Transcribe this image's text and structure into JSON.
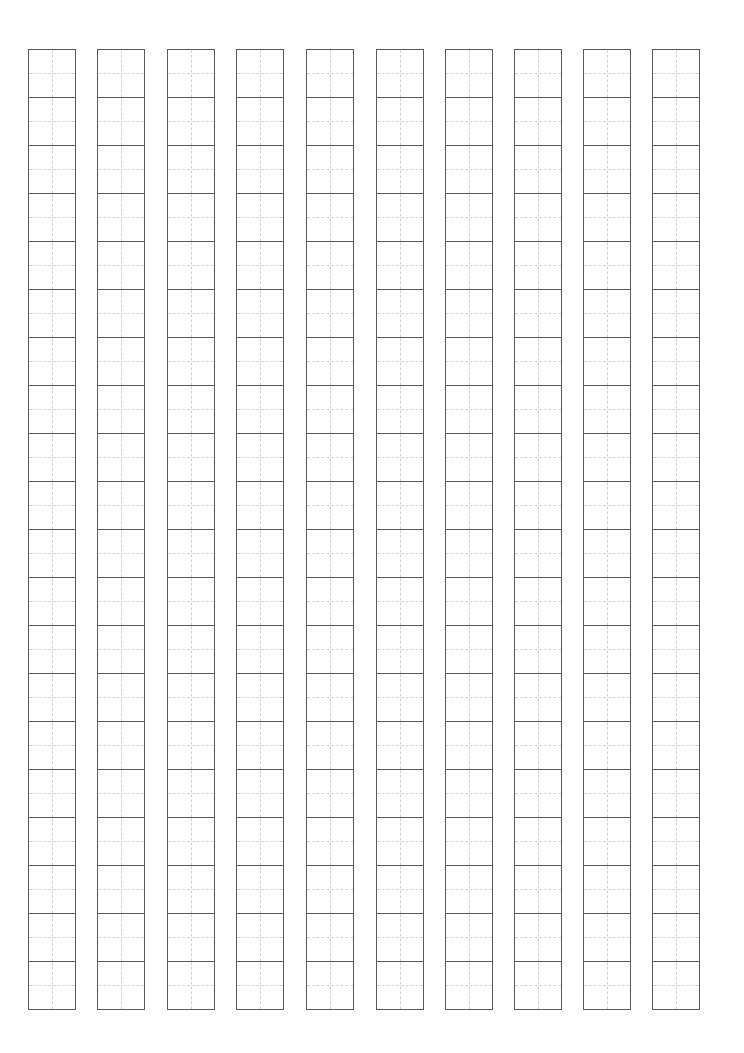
{
  "sheet": {
    "type": "tianzige-practice-grid",
    "column_count": 10,
    "cells_per_column": 20,
    "column_left_positions": [
      28,
      97,
      167,
      236,
      306,
      376,
      445,
      514,
      583,
      652
    ],
    "top": 49,
    "cell_size": 47,
    "colors": {
      "outline": "#5a5a5a",
      "guide": "#d2d2d2",
      "background": "#ffffff"
    }
  }
}
